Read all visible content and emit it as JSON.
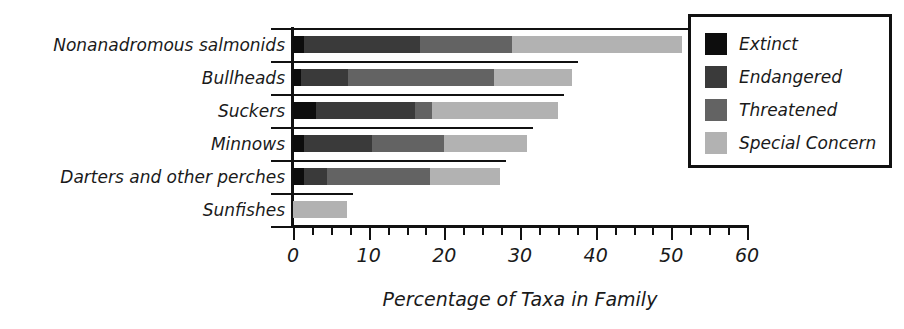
{
  "chart_data": {
    "type": "bar",
    "orientation": "horizontal",
    "stacked": true,
    "title": "",
    "xlabel": "Percentage of Taxa in Family",
    "ylabel": "",
    "xlim": [
      0,
      60
    ],
    "xticks": [
      0,
      10,
      20,
      30,
      40,
      50,
      60
    ],
    "xticklabels": [
      "0",
      "10",
      "20",
      "30",
      "40",
      "50",
      "60"
    ],
    "minor_tick_step": 2.5,
    "grid": false,
    "legend_position": "top-right",
    "categories": [
      "Nonanadromous salmonids",
      "Bullheads",
      "Suckers",
      "Minnows",
      "Darters and other perches",
      "Sunfishes"
    ],
    "series": [
      {
        "name": "Extinct",
        "color": "#0d0d0d",
        "values": [
          1.5,
          1.0,
          3.0,
          1.5,
          1.5,
          0.0
        ]
      },
      {
        "name": "Endangered",
        "color": "#3a3a3a",
        "values": [
          15.3,
          6.3,
          13.1,
          8.9,
          3.0,
          0.0
        ]
      },
      {
        "name": "Threatened",
        "color": "#636363",
        "values": [
          12.1,
          19.3,
          2.3,
          9.6,
          13.6,
          0.0
        ]
      },
      {
        "name": "Special Concern",
        "color": "#b2b2b2",
        "values": [
          22.5,
          10.3,
          16.6,
          10.9,
          9.2,
          7.1
        ]
      }
    ],
    "totals": [
      51.4,
      36.9,
      35.0,
      30.9,
      27.3,
      7.1
    ]
  },
  "legend": {
    "items": [
      {
        "label": "Extinct",
        "swatch": "extinct"
      },
      {
        "label": "Endangered",
        "swatch": "endangered"
      },
      {
        "label": "Threatened",
        "swatch": "threatened"
      },
      {
        "label": "Special Concern",
        "swatch": "special"
      }
    ]
  },
  "colors": {
    "extinct": "#0d0d0d",
    "endangered": "#3a3a3a",
    "threatened": "#636363",
    "special_concern": "#b2b2b2",
    "axis": "#111111",
    "background": "#ffffff"
  }
}
